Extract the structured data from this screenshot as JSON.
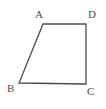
{
  "figure": {
    "name": "quadrilateral-abcd",
    "type": "polygon",
    "shape_name": "trapezoid",
    "background_color": "#ffffff",
    "stroke_color": "#4d4d4d",
    "stroke_width": 1.3,
    "fill": "none",
    "label_color": "#4d4d4d",
    "canvas": {
      "width": 106,
      "height": 109
    },
    "vertices": [
      {
        "id": "A",
        "label": "A",
        "x": 43,
        "y": 24,
        "label_x": 35,
        "label_y": 9
      },
      {
        "id": "D",
        "label": "D",
        "x": 86,
        "y": 24,
        "label_x": 88,
        "label_y": 9
      },
      {
        "id": "C",
        "label": "C",
        "x": 86,
        "y": 84,
        "label_x": 87,
        "label_y": 86
      },
      {
        "id": "B",
        "label": "B",
        "x": 19,
        "y": 83,
        "label_x": 7,
        "label_y": 83
      }
    ],
    "edges": [
      {
        "id": "AD",
        "from": "A",
        "to": "D"
      },
      {
        "id": "DC",
        "from": "D",
        "to": "C"
      },
      {
        "id": "CB",
        "from": "C",
        "to": "B"
      },
      {
        "id": "BA",
        "from": "B",
        "to": "A"
      }
    ],
    "polygon_points": "43,24 86,24 86,84 19,83"
  }
}
